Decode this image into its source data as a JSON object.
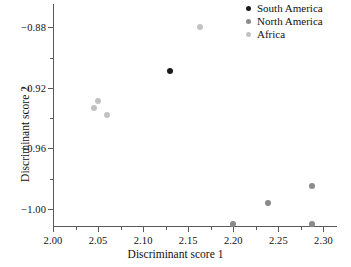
{
  "chart_data": {
    "type": "scatter",
    "title": "",
    "xlabel": "Discriminant score 1",
    "ylabel": "Discriminant score 2",
    "xlim": [
      2.0,
      2.315
    ],
    "ylim": [
      -1.012,
      -0.8645
    ],
    "grid": false,
    "legend_position": "top-right",
    "xticks": [
      "2.00",
      "2.05",
      "2.10",
      "2.15",
      "2.20",
      "2.25",
      "2.30"
    ],
    "xtick_values": [
      2.0,
      2.05,
      2.1,
      2.15,
      2.2,
      2.25,
      2.3
    ],
    "xminor_values": [
      2.025,
      2.075,
      2.125,
      2.175,
      2.225,
      2.275
    ],
    "yticks": [
      "−0.88",
      "−0.92",
      "−0.96",
      "−1.00"
    ],
    "ytick_values": [
      -0.88,
      -0.92,
      -0.96,
      -1.0
    ],
    "yminor_values": [
      -0.9,
      -0.94,
      -0.98
    ],
    "series": [
      {
        "name": "South America",
        "color": "#1a1a1a",
        "points": [
          {
            "x": 2.13,
            "y": -0.909
          }
        ]
      },
      {
        "name": "North America",
        "color": "#8a8a8a",
        "points": [
          {
            "x": 2.2,
            "y": -1.01
          },
          {
            "x": 2.238,
            "y": -0.9958
          },
          {
            "x": 2.287,
            "y": -0.985
          },
          {
            "x": 2.287,
            "y": -1.01
          }
        ]
      },
      {
        "name": "Africa",
        "color": "#c2c2c2",
        "points": [
          {
            "x": 2.163,
            "y": -0.88
          },
          {
            "x": 2.05,
            "y": -0.9288
          },
          {
            "x": 2.046,
            "y": -0.933
          },
          {
            "x": 2.06,
            "y": -0.9382
          }
        ]
      }
    ]
  },
  "legend": {
    "entries": [
      {
        "label": "South America",
        "color": "#1a1a1a"
      },
      {
        "label": "North America",
        "color": "#8a8a8a"
      },
      {
        "label": "Africa",
        "color": "#c2c2c2"
      }
    ]
  },
  "axes": {
    "x_title": "Discriminant score 1",
    "y_title": "Discriminant score 2"
  },
  "colors": {
    "axis": "#5a5a5a",
    "text": "#111111",
    "background": "#ffffff"
  }
}
